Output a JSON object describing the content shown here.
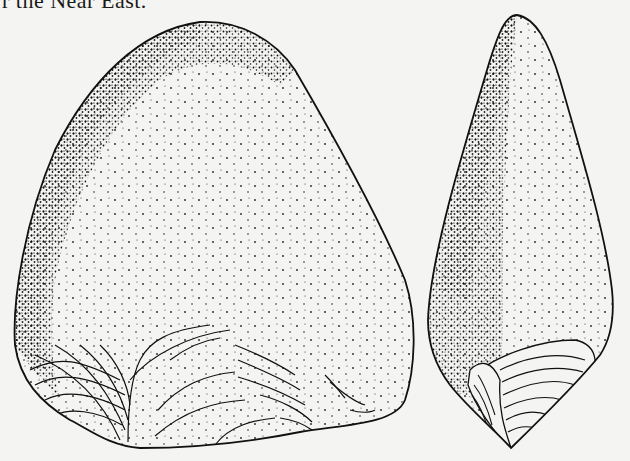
{
  "page": {
    "caption_fragment": "r the Near East."
  },
  "figure": {
    "views": [
      {
        "name": "face-view",
        "position": "left"
      },
      {
        "name": "profile-view",
        "position": "right"
      }
    ],
    "colors": {
      "ink": "#111111",
      "paper": "#f4f4f2"
    }
  }
}
